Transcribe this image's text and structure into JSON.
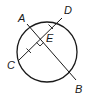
{
  "diagram": {
    "type": "geometry",
    "stroke_color": "#1a1a1a",
    "circle": {
      "cx": 47,
      "cy": 52,
      "r": 30
    },
    "points": {
      "A": {
        "label": "A",
        "x": 27,
        "y": 24
      },
      "B": {
        "label": "B",
        "x": 76,
        "y": 80
      },
      "C": {
        "label": "C",
        "x": 18,
        "y": 61
      },
      "D": {
        "label": "D",
        "x": 62,
        "y": 18
      },
      "E": {
        "label": "E",
        "x": 40,
        "y": 39
      }
    },
    "segments": [
      {
        "name": "chord-AB",
        "from": "A",
        "to": "B"
      },
      {
        "name": "chord-CD",
        "from": "C",
        "to": "D"
      }
    ],
    "marks": {
      "right_angle_at": "E",
      "congruent_ticks": [
        "CE",
        "ED"
      ]
    }
  }
}
